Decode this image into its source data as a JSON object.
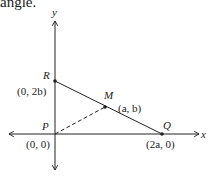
{
  "caption_fragment": "angle.",
  "axes": {
    "x_label": "x",
    "y_label": "y"
  },
  "points": {
    "R": {
      "name": "R",
      "coord": "(0, 2b)"
    },
    "M": {
      "name": "M",
      "coord": "(a, b)"
    },
    "P": {
      "name": "P",
      "coord": "(0, 0)"
    },
    "Q": {
      "name": "Q",
      "coord": "(2a, 0)"
    }
  },
  "segments": [
    {
      "from": "R",
      "to": "Q",
      "style": "solid"
    },
    {
      "from": "P",
      "to": "M",
      "style": "dashed"
    }
  ],
  "colors": {
    "ink": "#222222",
    "background": "#ffffff"
  }
}
